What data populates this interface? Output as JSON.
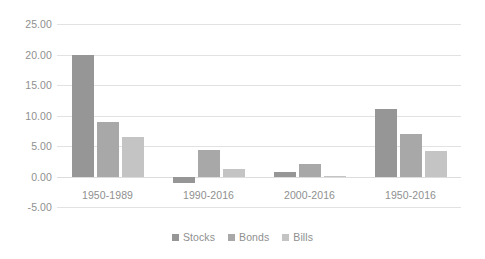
{
  "chart_data": {
    "type": "bar",
    "title": "",
    "subtitle": "",
    "xlabel": "",
    "ylabel": "",
    "categories": [
      "1950-1989",
      "1990-2016",
      "2000-2016",
      "1950-2016"
    ],
    "series": [
      {
        "name": "Stocks",
        "color": "#969696",
        "values": [
          20.0,
          -1.0,
          0.8,
          11.0
        ]
      },
      {
        "name": "Bonds",
        "color": "#a8a8a8",
        "values": [
          8.9,
          4.3,
          2.0,
          7.0
        ]
      },
      {
        "name": "Bills",
        "color": "#c4c4c4",
        "values": [
          6.5,
          1.2,
          0.1,
          4.2
        ]
      }
    ],
    "ylim": [
      -5.0,
      25.0
    ],
    "ytick_step": 5.0,
    "ytick_labels": [
      "25.00",
      "20.00",
      "15.00",
      "10.00",
      "5.00",
      "0.00",
      "-5.00"
    ],
    "ytick_values": [
      25.0,
      20.0,
      15.0,
      10.0,
      5.0,
      0.0,
      -5.0
    ],
    "grid": true,
    "grid_axis": "y",
    "grid_color": "#e2e2e2",
    "legend": {
      "position": "bottom",
      "entries": [
        "Stocks",
        "Bonds",
        "Bills"
      ]
    },
    "background": "#ffffff",
    "axis_text_color": "#8f8f8f"
  }
}
